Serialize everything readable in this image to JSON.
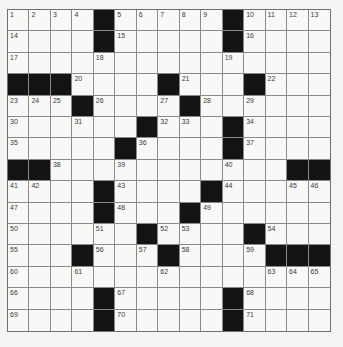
{
  "puzzle": {
    "rows": 15,
    "cols": 15,
    "colors": {
      "block": "#141414",
      "cell": "#f8f8f6",
      "line": "#8a8a8a",
      "number": "#3a3a3a"
    },
    "grid": [
      [
        "1",
        "2",
        "3",
        "4",
        "#",
        "5",
        "6",
        "7",
        "8",
        "9",
        "#",
        "10",
        "11",
        "12",
        "13"
      ],
      [
        "14",
        ".",
        ".",
        ".",
        "#",
        "15",
        ".",
        ".",
        ".",
        ".",
        "#",
        "16",
        ".",
        ".",
        "."
      ],
      [
        "17",
        ".",
        ".",
        ".",
        "18",
        ".",
        ".",
        ".",
        ".",
        ".",
        "19",
        ".",
        ".",
        ".",
        "."
      ],
      [
        "#",
        "#",
        "#",
        "20",
        ".",
        ".",
        ".",
        "#",
        "21",
        ".",
        ".",
        "#",
        "22",
        ".",
        "."
      ],
      [
        "23",
        "24",
        "25",
        "#",
        "26",
        ".",
        ".",
        "27",
        "#",
        "28",
        ".",
        "29",
        ".",
        ".",
        "."
      ],
      [
        "30",
        ".",
        ".",
        "31",
        ".",
        ".",
        "#",
        "32",
        "33",
        ".",
        "#",
        "34",
        ".",
        ".",
        "."
      ],
      [
        "35",
        ".",
        ".",
        ".",
        ".",
        "#",
        "36",
        ".",
        ".",
        ".",
        "#",
        "37",
        ".",
        ".",
        "."
      ],
      [
        "#",
        "#",
        "38",
        ".",
        ".",
        "39",
        ".",
        ".",
        ".",
        ".",
        "40",
        ".",
        ".",
        "#",
        "#"
      ],
      [
        "41",
        "42",
        ".",
        ".",
        "#",
        "43",
        ".",
        ".",
        ".",
        "#",
        "44",
        ".",
        ".",
        "45",
        "46"
      ],
      [
        "47",
        ".",
        ".",
        ".",
        "#",
        "48",
        ".",
        ".",
        "#",
        "49",
        ".",
        ".",
        ".",
        ".",
        "."
      ],
      [
        "50",
        ".",
        ".",
        ".",
        "51",
        ".",
        "#",
        "52",
        "53",
        ".",
        ".",
        "#",
        "54",
        ".",
        "."
      ],
      [
        "55",
        ".",
        ".",
        "#",
        "56",
        ".",
        "57",
        "#",
        "58",
        ".",
        ".",
        "59",
        "#",
        "#",
        "#"
      ],
      [
        "60",
        ".",
        ".",
        "61",
        ".",
        ".",
        ".",
        "62",
        ".",
        ".",
        ".",
        ".",
        "63",
        "64",
        "65"
      ],
      [
        "66",
        ".",
        ".",
        ".",
        "#",
        "67",
        ".",
        ".",
        ".",
        ".",
        "#",
        "68",
        ".",
        ".",
        "."
      ],
      [
        "69",
        ".",
        ".",
        ".",
        "#",
        "70",
        ".",
        ".",
        ".",
        ".",
        "#",
        "71",
        ".",
        ".",
        "."
      ]
    ]
  }
}
